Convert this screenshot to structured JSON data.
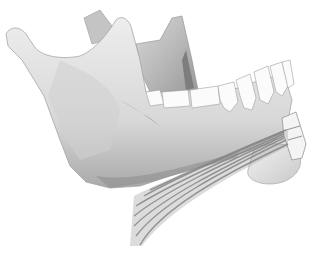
{
  "image": {
    "subject": "mandible-illustration",
    "background": "#ffffff",
    "colors": {
      "bone_light": "#ececec",
      "bone_mid": "#c8c8c8",
      "bone_dark": "#8a8a8a",
      "tooth": "#fbfbfb",
      "tooth_outline": "#a0a0a0",
      "muscle": "#7a7a7a"
    }
  }
}
